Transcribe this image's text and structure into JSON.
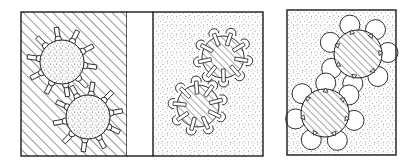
{
  "figure": {
    "background": "#ffffff",
    "ink": "#1a1a1a",
    "panels": [
      {
        "id": "panel-1",
        "description": "stippled particle cores with pin-shaped surface chains dispersed in a hatched medium",
        "x": 21,
        "y": 12,
        "width": 106,
        "height": 144,
        "medium": "hatched",
        "core_fill": "stippled",
        "ligand_style": "pin-outward",
        "particles": [
          {
            "cx": 62,
            "cy": 62,
            "r": 22,
            "ligands": 10
          },
          {
            "cx": 88,
            "cy": 117,
            "r": 22,
            "ligands": 10
          }
        ]
      },
      {
        "id": "blank-strip",
        "x": 127,
        "y": 12,
        "width": 26,
        "height": 144,
        "medium": "blank"
      },
      {
        "id": "panel-2",
        "description": "hatched particle cores with folded mushroom chains in a stippled medium",
        "x": 153,
        "y": 12,
        "width": 110,
        "height": 144,
        "medium": "stippled",
        "core_fill": "hatched",
        "ligand_style": "mushroom-inward",
        "particles": [
          {
            "cx": 223,
            "cy": 57,
            "r": 21,
            "ligands": 9
          },
          {
            "cx": 198,
            "cy": 106,
            "r": 21,
            "ligands": 9
          }
        ]
      },
      {
        "id": "panel-3",
        "description": "hatched particle cores with large rounded lobe chains in a stippled medium",
        "x": 287,
        "y": 10,
        "width": 109,
        "height": 145,
        "medium": "stippled",
        "core_fill": "hatched",
        "ligand_style": "round-lobes",
        "particles": [
          {
            "cx": 358,
            "cy": 54,
            "r": 24,
            "ligands": 7
          },
          {
            "cx": 325,
            "cy": 113,
            "r": 24,
            "ligands": 7
          }
        ]
      }
    ]
  }
}
